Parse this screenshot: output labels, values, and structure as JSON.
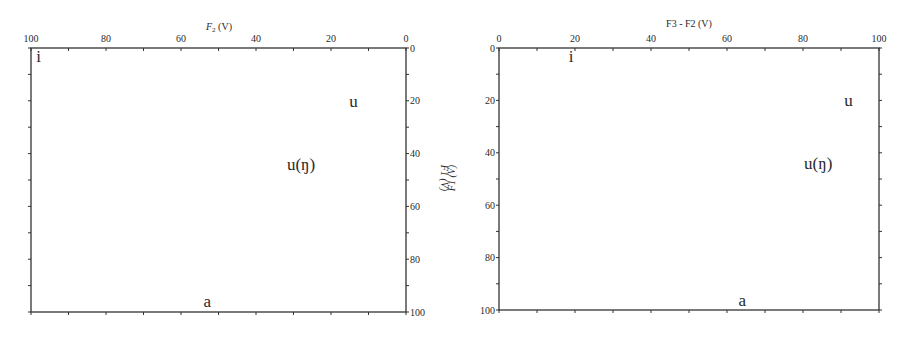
{
  "figure": {
    "left_panel": {
      "xlabel": "F2 (V)",
      "xlabel_main": "F",
      "xlabel_sub": "2",
      "xlabel_unit": " (V)",
      "x_ticks": [
        "100",
        "80",
        "60",
        "40",
        "20",
        "0"
      ],
      "y_ticks_right": [
        "0",
        "20",
        "40",
        "60",
        "80",
        "100"
      ],
      "ylabel_rotated_1": "F1 (V)",
      "ylabel_rotated_2": "F1 (V)",
      "points": [
        {
          "label": "i",
          "x": 98,
          "y": 3
        },
        {
          "label": "u",
          "x": 14,
          "y": 20
        },
        {
          "label": "u(ŋ)",
          "x": 28,
          "y": 44
        },
        {
          "label": "a",
          "x": 53,
          "y": 96
        }
      ]
    },
    "right_panel": {
      "xlabel": "F3 - F2 (V)",
      "x_ticks": [
        "0",
        "20",
        "40",
        "60",
        "80",
        "100"
      ],
      "y_ticks_left": [
        "0",
        "20",
        "40",
        "60",
        "80",
        "100"
      ],
      "points": [
        {
          "label": "i",
          "x": 19,
          "y": 3
        },
        {
          "label": "u",
          "x": 92,
          "y": 20
        },
        {
          "label": "u(ŋ)",
          "x": 84,
          "y": 44
        },
        {
          "label": "a",
          "x": 64,
          "y": 96
        }
      ]
    }
  },
  "chart_data": [
    {
      "type": "scatter",
      "title": "",
      "xlabel": "F2 (V)",
      "ylabel": "F1 (V)",
      "xlim": [
        100,
        0
      ],
      "ylim": [
        100,
        0
      ],
      "x_reversed": true,
      "y_reversed": true,
      "x_ticks": [
        100,
        80,
        60,
        40,
        20,
        0
      ],
      "y_ticks": [
        0,
        20,
        40,
        60,
        80,
        100
      ],
      "y_axis_position": "right",
      "x_axis_position": "top",
      "grid": false,
      "series": [
        {
          "name": "vowels",
          "points": [
            {
              "label": "i",
              "x": 98,
              "y": 3
            },
            {
              "label": "u",
              "x": 14,
              "y": 20
            },
            {
              "label": "u(ŋ)",
              "x": 28,
              "y": 44
            },
            {
              "label": "a",
              "x": 53,
              "y": 96
            }
          ]
        }
      ]
    },
    {
      "type": "scatter",
      "title": "",
      "xlabel": "F3 - F2 (V)",
      "ylabel": "F1 (V)",
      "xlim": [
        0,
        100
      ],
      "ylim": [
        100,
        0
      ],
      "y_reversed": true,
      "x_ticks": [
        0,
        20,
        40,
        60,
        80,
        100
      ],
      "y_ticks": [
        0,
        20,
        40,
        60,
        80,
        100
      ],
      "y_axis_position": "left",
      "x_axis_position": "top",
      "grid": false,
      "series": [
        {
          "name": "vowels",
          "points": [
            {
              "label": "i",
              "x": 19,
              "y": 3
            },
            {
              "label": "u",
              "x": 92,
              "y": 20
            },
            {
              "label": "u(ŋ)",
              "x": 84,
              "y": 44
            },
            {
              "label": "a",
              "x": 64,
              "y": 96
            }
          ]
        }
      ]
    }
  ]
}
